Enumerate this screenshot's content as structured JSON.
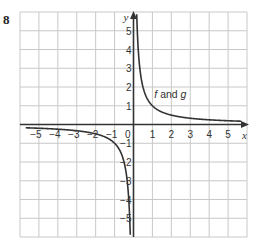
{
  "question_number": "8",
  "chart_data": {
    "type": "line",
    "title": "",
    "xlabel": "x",
    "ylabel": "y",
    "xlim": [
      -6,
      6
    ],
    "ylim": [
      -6,
      6
    ],
    "grid": true,
    "x_ticks": [
      "-5",
      "-4",
      "-3",
      "-2",
      "-1",
      "1",
      "2",
      "3",
      "4",
      "5"
    ],
    "y_ticks": [
      "5",
      "4",
      "3",
      "2",
      "1",
      "-1",
      "-2",
      "-3",
      "-4",
      "-5"
    ],
    "origin_label": "0",
    "series": [
      {
        "name": "f and g",
        "function": "y = 1/x",
        "branches": [
          {
            "x_range": [
              0.17,
              5.7
            ]
          },
          {
            "x_range": [
              -5.7,
              -0.17
            ]
          }
        ]
      }
    ],
    "annotations": [
      {
        "text": "f and g",
        "x": 1.1,
        "y": 1.4
      }
    ]
  }
}
